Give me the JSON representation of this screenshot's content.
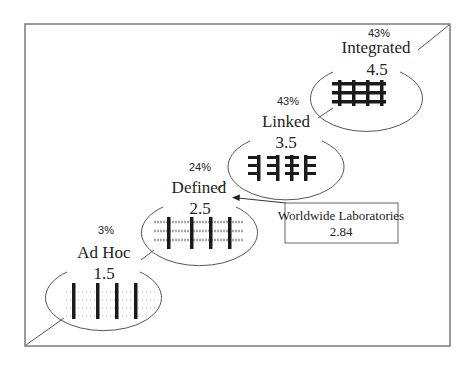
{
  "diagram": {
    "colors": {
      "frame": "#7a7a7a",
      "ellipse": "#555555",
      "bar": "#1a1a1a",
      "grid_light": "#b5b5b5",
      "text": "#222222"
    },
    "levels": [
      {
        "name": "Ad Hoc",
        "score": "1.5",
        "percent": "3%"
      },
      {
        "name": "Defined",
        "score": "2.5",
        "percent": "24%"
      },
      {
        "name": "Linked",
        "score": "3.5",
        "percent": "43%"
      },
      {
        "name": "Integrated",
        "score": "4.5",
        "percent": "43%"
      }
    ],
    "callout": {
      "label": "Worldwide Laboratories",
      "value": "2.84",
      "points_to": "Defined"
    }
  }
}
